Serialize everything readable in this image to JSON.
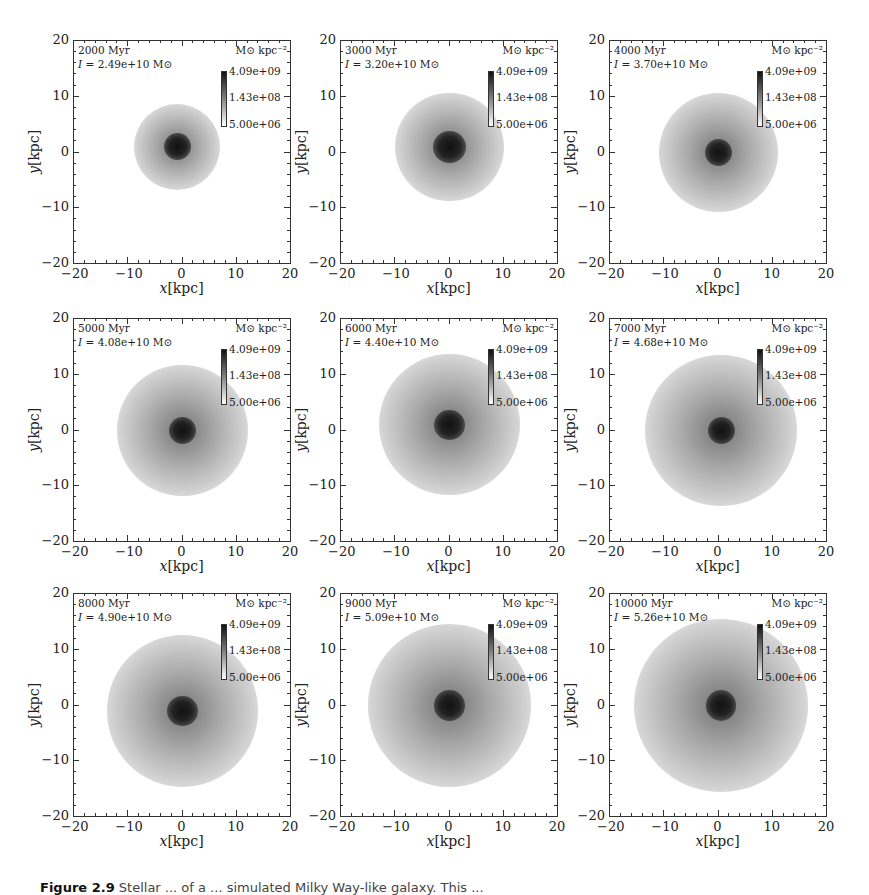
{
  "chart_data": {
    "type": "heatmap",
    "layout": {
      "rows": 3,
      "cols": 3,
      "grid": false,
      "colorbar_position": "upper-right inside each panel"
    },
    "xlabel": "x[kpc]",
    "ylabel": "y[kpc]",
    "xlim": [
      -20,
      20
    ],
    "ylim": [
      -20,
      20
    ],
    "xticks": [
      "-20",
      "-10",
      "0",
      "10",
      "20"
    ],
    "yticks": [
      "20",
      "10",
      "0",
      "-10",
      "-20"
    ],
    "colorbar": {
      "unit": "M☉ kpc⁻²",
      "scale": "log",
      "colormap": "grayscale (white = low, black = high)",
      "ticks": [
        "4.09e+09",
        "1.43e+08",
        "5.00e+06"
      ],
      "range": [
        5000000.0,
        4090000000.0
      ]
    },
    "panels": [
      {
        "time": "2000 Myr",
        "time_myr": 2000,
        "I_label": "I = 2.49e+10 M☉",
        "I": 24900000000.0,
        "disk_radius_kpc": 8,
        "description": "compact disk with dark bar/spiral lanes near center"
      },
      {
        "time": "3000 Myr",
        "time_myr": 3000,
        "I_label": "I = 3.20e+10 M☉",
        "I": 32000000000.0,
        "disk_radius_kpc": 10,
        "description": "spiral arms, dark central region"
      },
      {
        "time": "4000 Myr",
        "time_myr": 4000,
        "I_label": "I = 3.70e+10 M☉",
        "I": 37000000000.0,
        "disk_radius_kpc": 11,
        "description": "spiral disk with concentrated dark core"
      },
      {
        "time": "5000 Myr",
        "time_myr": 5000,
        "I_label": "I = 4.08e+10 M☉",
        "I": 40800000000.0,
        "disk_radius_kpc": 12,
        "description": "spiral disk with dark core"
      },
      {
        "time": "6000 Myr",
        "time_myr": 6000,
        "I_label": "I = 4.40e+10 M☉",
        "I": 44000000000.0,
        "disk_radius_kpc": 13,
        "description": "extended disk, triangular dark core"
      },
      {
        "time": "7000 Myr",
        "time_myr": 7000,
        "I_label": "I = 4.68e+10 M☉",
        "I": 46800000000.0,
        "disk_radius_kpc": 14,
        "description": "extended disk with dark core"
      },
      {
        "time": "8000 Myr",
        "time_myr": 8000,
        "I_label": "I = 4.90e+10 M☉",
        "I": 49000000000.0,
        "disk_radius_kpc": 14,
        "description": "extended disk with dark core"
      },
      {
        "time": "9000 Myr",
        "time_myr": 9000,
        "I_label": "I = 5.09e+10 M☉",
        "I": 50900000000.0,
        "disk_radius_kpc": 15,
        "description": "extended disk with dark core"
      },
      {
        "time": "10000 Myr",
        "time_myr": 10000,
        "I_label": "I = 5.26e+10 M☉",
        "I": 52600000000.0,
        "disk_radius_kpc": 16,
        "description": "large smooth disk with dark core"
      }
    ]
  },
  "axes": {
    "xlabel_var": "x",
    "ylabel_var": "y",
    "unit": "[kpc]",
    "xticks": [
      "−20",
      "−10",
      "0",
      "10",
      "20"
    ],
    "yticks": [
      "20",
      "10",
      "0",
      "−10",
      "−20"
    ]
  },
  "colorbar": {
    "unit": "M⊙ kpc⁻²",
    "ticks": [
      "4.09e+09",
      "1.43e+08",
      "5.00e+06"
    ]
  },
  "panels": [
    {
      "time": "2000 Myr",
      "i_eq": " = 2.49e+10 M⊙"
    },
    {
      "time": "3000 Myr",
      "i_eq": " = 3.20e+10 M⊙"
    },
    {
      "time": "4000 Myr",
      "i_eq": " = 3.70e+10 M⊙"
    },
    {
      "time": "5000 Myr",
      "i_eq": " = 4.08e+10 M⊙"
    },
    {
      "time": "6000 Myr",
      "i_eq": " = 4.40e+10 M⊙"
    },
    {
      "time": "7000 Myr",
      "i_eq": " = 4.68e+10 M⊙"
    },
    {
      "time": "8000 Myr",
      "i_eq": " = 4.90e+10 M⊙"
    },
    {
      "time": "9000 Myr",
      "i_eq": " = 5.09e+10 M⊙"
    },
    {
      "time": "10000 Myr",
      "i_eq": " = 5.26e+10 M⊙"
    }
  ],
  "i_symbol": "I",
  "caption": {
    "label": "Figure 2.9",
    "text": " Stellar ... of a ... simulated Milky Way-like galaxy. This ..."
  }
}
